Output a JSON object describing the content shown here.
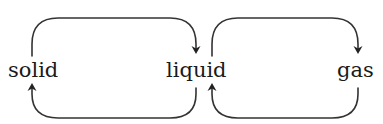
{
  "diagram": {
    "type": "state-transition",
    "nodes": [
      {
        "id": "solid",
        "label": "solid"
      },
      {
        "id": "liquid",
        "label": "liquid"
      },
      {
        "id": "gas",
        "label": "gas"
      }
    ],
    "edges": [
      {
        "from": "solid",
        "to": "liquid",
        "path": "top"
      },
      {
        "from": "liquid",
        "to": "solid",
        "path": "bottom"
      },
      {
        "from": "liquid",
        "to": "gas",
        "path": "top"
      },
      {
        "from": "gas",
        "to": "liquid",
        "path": "bottom"
      }
    ],
    "colors": {
      "stroke": "#333333",
      "text": "#1a1a1a",
      "background": "#ffffff"
    }
  }
}
